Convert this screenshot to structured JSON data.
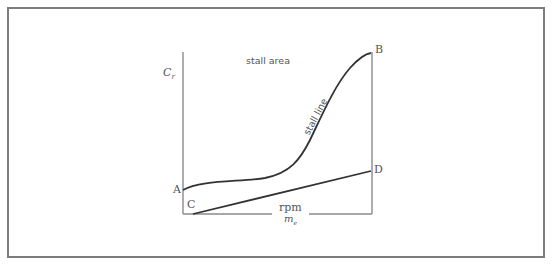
{
  "diagram": {
    "y_axis_label": "C",
    "y_axis_label_sub": "r",
    "x_axis_label_top": "rpm",
    "x_axis_label_bottom": "m",
    "x_axis_label_bottom_sub": "e",
    "region_label": "stall area",
    "curve_label": "stall line",
    "points": {
      "A": "A",
      "B": "B",
      "C": "C",
      "D": "D"
    },
    "colors": {
      "frame": "#7d7d7d",
      "axes": "#8a8a8a",
      "curve": "#333333",
      "text": "#555555"
    }
  }
}
